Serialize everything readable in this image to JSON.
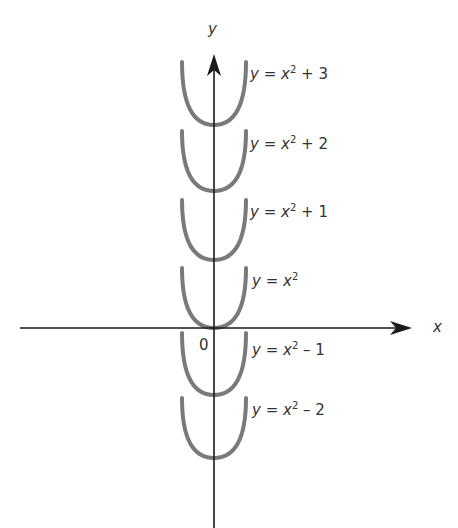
{
  "figure": {
    "axes": {
      "x_label": "x",
      "y_label": "y",
      "origin_label": "0",
      "axis_color": "#1a1a1a"
    },
    "curve_color": "#777777",
    "curves": [
      {
        "shift": 3,
        "lhs": "y",
        "eq": "=",
        "var": "x",
        "exp": "2",
        "op": "+",
        "const": "3"
      },
      {
        "shift": 2,
        "lhs": "y",
        "eq": "=",
        "var": "x",
        "exp": "2",
        "op": "+",
        "const": "2"
      },
      {
        "shift": 1,
        "lhs": "y",
        "eq": "=",
        "var": "x",
        "exp": "2",
        "op": "+",
        "const": "1"
      },
      {
        "shift": 0,
        "lhs": "y",
        "eq": "=",
        "var": "x",
        "exp": "2",
        "op": "",
        "const": ""
      },
      {
        "shift": -1,
        "lhs": "y",
        "eq": "=",
        "var": "x",
        "exp": "2",
        "op": "–",
        "const": "1"
      },
      {
        "shift": -2,
        "lhs": "y",
        "eq": "=",
        "var": "x",
        "exp": "2",
        "op": "–",
        "const": "2"
      }
    ]
  }
}
